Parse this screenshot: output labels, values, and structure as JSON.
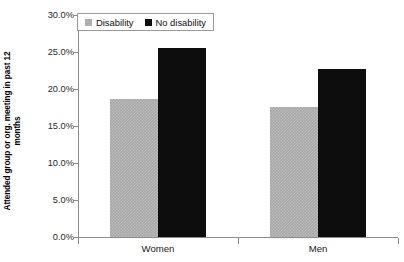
{
  "chart_data": {
    "type": "bar",
    "title": "",
    "subtitle": "",
    "xlabel": "",
    "ylabel": "Attended group or org. meeting in past 12 months",
    "ylabel_line1": "Attended group or org. meeting in past 12",
    "ylabel_line2": "months",
    "categories": [
      "Women",
      "Men"
    ],
    "series": [
      {
        "name": "Disability",
        "color": "#a9a9a9",
        "values": [
          18.6,
          17.6
        ]
      },
      {
        "name": "No disability",
        "color": "#0d0d0d",
        "values": [
          25.5,
          22.7
        ]
      }
    ],
    "ylim": [
      0,
      30
    ],
    "ytick_values": [
      0,
      5,
      10,
      15,
      20,
      25,
      30
    ],
    "ytick_labels": [
      "0.0%",
      "5.0%",
      "10.0%",
      "15.0%",
      "20.0%",
      "25.0%",
      "30.0%"
    ],
    "grid": false,
    "legend_position": "top-left",
    "value_format": "percent"
  },
  "legend": {
    "entries": [
      {
        "label": "Disability",
        "swatch": "gray-square-icon"
      },
      {
        "label": "No disability",
        "swatch": "black-square-icon"
      }
    ]
  },
  "axes": {
    "y_title_line1": "Attended group or org. meeting in past 12",
    "y_title_line2": "months",
    "y_ticks": [
      "30.0%",
      "25.0%",
      "20.0%",
      "15.0%",
      "10.0%",
      "5.0%",
      "0.0%"
    ],
    "x_categories": [
      "Women",
      "Men"
    ]
  }
}
